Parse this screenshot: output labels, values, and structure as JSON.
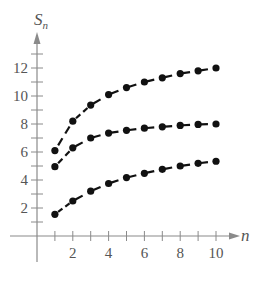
{
  "chart_data": {
    "type": "scatter",
    "title": "",
    "xlabel": "n",
    "ylabel": "S_n",
    "ylabel_main": "S",
    "ylabel_sub": "n",
    "xlim": [
      0,
      11.5
    ],
    "ylim": [
      0,
      13
    ],
    "x_ticks": [
      1,
      2,
      3,
      4,
      5,
      6,
      7,
      8,
      9,
      10
    ],
    "x_tick_labels": [
      "2",
      "4",
      "6",
      "8",
      "10"
    ],
    "x_tick_label_values": [
      2,
      4,
      6,
      8,
      10
    ],
    "y_ticks": [
      1,
      2,
      3,
      4,
      5,
      6,
      7,
      8,
      9,
      10,
      11,
      12,
      13
    ],
    "y_tick_labels": [
      "2",
      "4",
      "6",
      "8",
      "10",
      "12"
    ],
    "y_tick_label_values": [
      2,
      4,
      6,
      8,
      10,
      12
    ],
    "grid": false,
    "legend": "none",
    "style": "points connected by dashed line",
    "x": [
      1,
      2,
      3,
      4,
      5,
      6,
      7,
      8,
      9,
      10
    ],
    "series": [
      {
        "name": "upper",
        "values": [
          6.1,
          8.2,
          9.35,
          10.1,
          10.6,
          11.0,
          11.3,
          11.6,
          11.8,
          12.0
        ]
      },
      {
        "name": "middle",
        "values": [
          4.95,
          6.3,
          7.0,
          7.35,
          7.55,
          7.7,
          7.8,
          7.9,
          7.97,
          8.0
        ]
      },
      {
        "name": "lower",
        "values": [
          1.55,
          2.5,
          3.2,
          3.75,
          4.17,
          4.48,
          4.76,
          5.0,
          5.19,
          5.34
        ]
      }
    ],
    "colors": {
      "axis": "#8a8a8a",
      "points": "#111111",
      "text": "#555555"
    }
  }
}
